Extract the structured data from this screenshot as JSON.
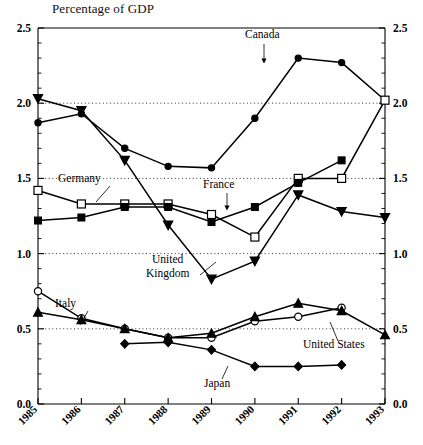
{
  "chart_data": {
    "type": "line",
    "title": "Percentage of GDP",
    "xlabel": "",
    "ylabel": "",
    "x": [
      "1985",
      "1986",
      "1987",
      "1988",
      "1989",
      "1990",
      "1991",
      "1992",
      "1993"
    ],
    "xlim": [
      1985,
      1993
    ],
    "ylim": [
      0.0,
      2.5
    ],
    "yticks": [
      "0.0",
      "0.5",
      "1.0",
      "1.5",
      "2.0",
      "2.5"
    ],
    "ytick_values": [
      0.0,
      0.5,
      1.0,
      1.5,
      2.0,
      2.5
    ],
    "y_minor_tick_step": 0.1,
    "grid": "horizontal dotted at 0.5, 1.0, 1.5, 2.0",
    "legend": "inline labels with leader lines",
    "dual_axis": "identical y-axis labels on left and right",
    "series": [
      {
        "name": "Canada",
        "marker": "filled-circle",
        "x": [
          "1985",
          "1986",
          "1987",
          "1988",
          "1989",
          "1990",
          "1991",
          "1992",
          "1993"
        ],
        "values": [
          1.87,
          1.93,
          1.7,
          1.58,
          1.57,
          1.9,
          2.3,
          2.27,
          2.02
        ]
      },
      {
        "name": "United Kingdom",
        "marker": "filled-triangle-down",
        "x": [
          "1985",
          "1986",
          "1987",
          "1988",
          "1989",
          "1990",
          "1991",
          "1992",
          "1993"
        ],
        "values": [
          2.03,
          1.95,
          1.62,
          1.19,
          0.83,
          0.95,
          1.39,
          1.28,
          1.24
        ]
      },
      {
        "name": "Germany",
        "marker": "open-square",
        "x": [
          "1985",
          "1986",
          "1987",
          "1988",
          "1989",
          "1990",
          "1991",
          "1992",
          "1993"
        ],
        "values": [
          1.42,
          1.33,
          1.33,
          1.33,
          1.26,
          1.11,
          1.5,
          1.5,
          2.02
        ]
      },
      {
        "name": "France",
        "marker": "filled-square",
        "x": [
          "1985",
          "1986",
          "1987",
          "1988",
          "1989",
          "1990",
          "1991",
          "1992"
        ],
        "values": [
          1.22,
          1.24,
          1.31,
          1.31,
          1.21,
          1.31,
          1.47,
          1.62
        ]
      },
      {
        "name": "Italy",
        "marker": "open-circle",
        "x": [
          "1985",
          "1986",
          "1987",
          "1988",
          "1989",
          "1990",
          "1991",
          "1992"
        ],
        "values": [
          0.75,
          0.57,
          0.5,
          0.44,
          0.44,
          0.55,
          0.58,
          0.64
        ]
      },
      {
        "name": "United States",
        "marker": "filled-triangle-up",
        "x": [
          "1985",
          "1986",
          "1987",
          "1988",
          "1989",
          "1990",
          "1991",
          "1992",
          "1993"
        ],
        "values": [
          0.61,
          0.56,
          0.5,
          0.44,
          0.47,
          0.58,
          0.67,
          0.62,
          0.46
        ]
      },
      {
        "name": "Japan",
        "marker": "filled-diamond",
        "x": [
          "1987",
          "1988",
          "1989",
          "1990",
          "1991",
          "1992"
        ],
        "values": [
          0.4,
          0.41,
          0.36,
          0.25,
          0.25,
          0.26
        ]
      }
    ],
    "annotations": [
      {
        "text": "Canada",
        "kind": "series-label"
      },
      {
        "text": "Germany",
        "kind": "series-label"
      },
      {
        "text": "France",
        "kind": "series-label"
      },
      {
        "text": "United",
        "kind": "series-label"
      },
      {
        "text": "Kingdom",
        "kind": "series-label"
      },
      {
        "text": "Italy",
        "kind": "series-label"
      },
      {
        "text": "United States",
        "kind": "series-label"
      },
      {
        "text": "Japan",
        "kind": "series-label"
      }
    ]
  },
  "labels": {
    "canada": "Canada",
    "germany": "Germany",
    "france": "France",
    "uk_line1": "United",
    "uk_line2": "Kingdom",
    "italy": "Italy",
    "united_states": "United States",
    "japan": "Japan"
  },
  "yticks": {
    "t0": "0.0",
    "t1": "0.5",
    "t2": "1.0",
    "t3": "1.5",
    "t4": "2.0",
    "t5": "2.5"
  },
  "xticks": {
    "x0": "1985",
    "x1": "1986",
    "x2": "1987",
    "x3": "1988",
    "x4": "1989",
    "x5": "1990",
    "x6": "1991",
    "x7": "1992",
    "x8": "1993"
  },
  "colors": {
    "ink": "#000000",
    "background": "#ffffff"
  }
}
